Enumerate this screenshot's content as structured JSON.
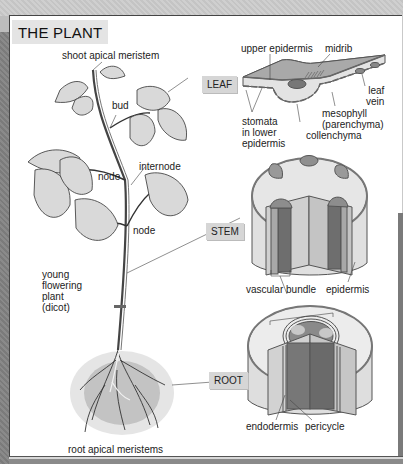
{
  "title": "THE PLANT",
  "organ_tags": {
    "leaf": "LEAF",
    "stem": "STEM",
    "root": "ROOT"
  },
  "plant_labels": {
    "shoot_apical_meristem": "shoot apical meristem",
    "bud": "bud",
    "internode": "internode",
    "node_upper": "node",
    "node_lower": "node",
    "young_plant": "young\nflowering\nplant\n(dicot)",
    "root_apical_meristems": "root apical meristems"
  },
  "leaf_labels": {
    "upper_epidermis": "upper epidermis",
    "midrib": "midrib",
    "leaf_vein": "leaf\nvein",
    "stomata": "stomata\nin lower\nepidermis",
    "mesophyll": "mesophyll\n(parenchyma)",
    "collenchyma": "collenchyma"
  },
  "stem_labels": {
    "vascular_bundle": "vascular bundle",
    "epidermis": "epidermis"
  },
  "root_labels": {
    "endodermis": "endodermis",
    "pericycle": "pericycle"
  },
  "colors": {
    "frame_gray": "#c9c9c9",
    "panel": "#ffffff",
    "tag_fill": "#d6d6d6",
    "tissue_light": "#e6e6e6",
    "tissue_mid": "#a8a8a8",
    "tissue_dark": "#6e6e6e"
  }
}
